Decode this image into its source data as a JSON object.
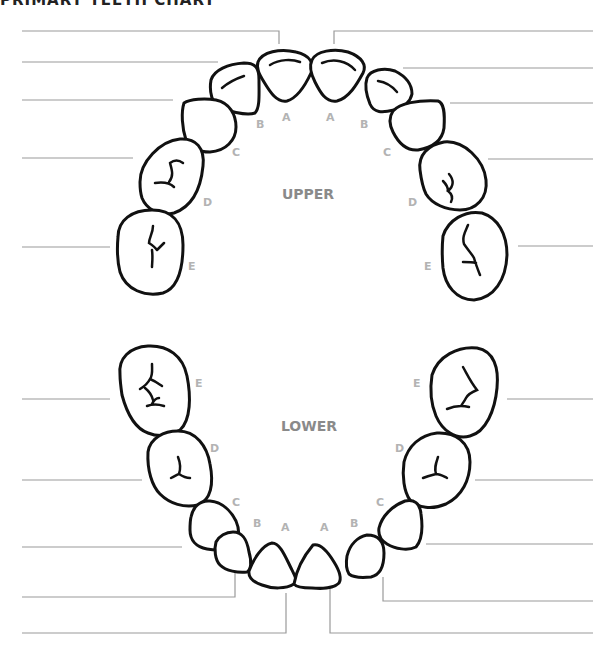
{
  "title": "PRIMARY TEETH CHART",
  "arches": {
    "upper": {
      "label": "UPPER"
    },
    "lower": {
      "label": "LOWER"
    }
  },
  "tooth_labels": {
    "upper_left": [
      "A",
      "B",
      "C",
      "D",
      "E"
    ],
    "upper_right": [
      "A",
      "B",
      "C",
      "D",
      "E"
    ],
    "lower_left": [
      "A",
      "B",
      "C",
      "D",
      "E"
    ],
    "lower_right": [
      "A",
      "B",
      "C",
      "D",
      "E"
    ]
  },
  "answer_lines": {
    "upper_left": [
      "",
      "",
      "",
      "",
      ""
    ],
    "upper_right": [
      "",
      "",
      "",
      "",
      ""
    ],
    "lower_left": [
      "",
      "",
      "",
      "",
      ""
    ],
    "lower_right": [
      "",
      "",
      "",
      "",
      ""
    ]
  },
  "colors": {
    "outline": "#111111",
    "leader_line": "#9a9a9a",
    "tooth_label": "#b3b3b3",
    "arch_label": "#8a8a8a"
  }
}
